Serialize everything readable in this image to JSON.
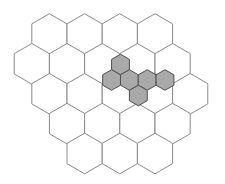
{
  "diagram": {
    "type": "hexagonal-grid",
    "orientation": "pointy-top",
    "colors": {
      "background": "#ffffff",
      "grid_stroke": "#8a8a8a",
      "shaded_fill": "#a9a9a9",
      "shaded_stroke": "#4f4f4f"
    },
    "large_grid": {
      "radius": 20.3,
      "rows": [
        {
          "y": 34,
          "x": [
            49.4,
            84.6,
            119.8,
            155.0
          ]
        },
        {
          "y": 63.8,
          "x": [
            31.8,
            67.0,
            102.2,
            137.4,
            172.6
          ]
        },
        {
          "y": 93.8,
          "x": [
            49.4,
            84.6,
            119.8,
            155.0,
            190.2
          ]
        },
        {
          "y": 123.6,
          "x": [
            67.0,
            102.2,
            137.4,
            172.6
          ]
        },
        {
          "y": 153.5,
          "x": [
            84.6,
            119.8,
            155.0
          ]
        }
      ]
    },
    "shaded_cluster": {
      "radius": 10.3,
      "cells": [
        {
          "x": 120.5,
          "y": 64.5
        },
        {
          "x": 111.6,
          "y": 80.0
        },
        {
          "x": 129.4,
          "y": 80.0
        },
        {
          "x": 147.2,
          "y": 80.0
        },
        {
          "x": 165.0,
          "y": 80.0
        },
        {
          "x": 138.3,
          "y": 95.5
        }
      ]
    }
  }
}
